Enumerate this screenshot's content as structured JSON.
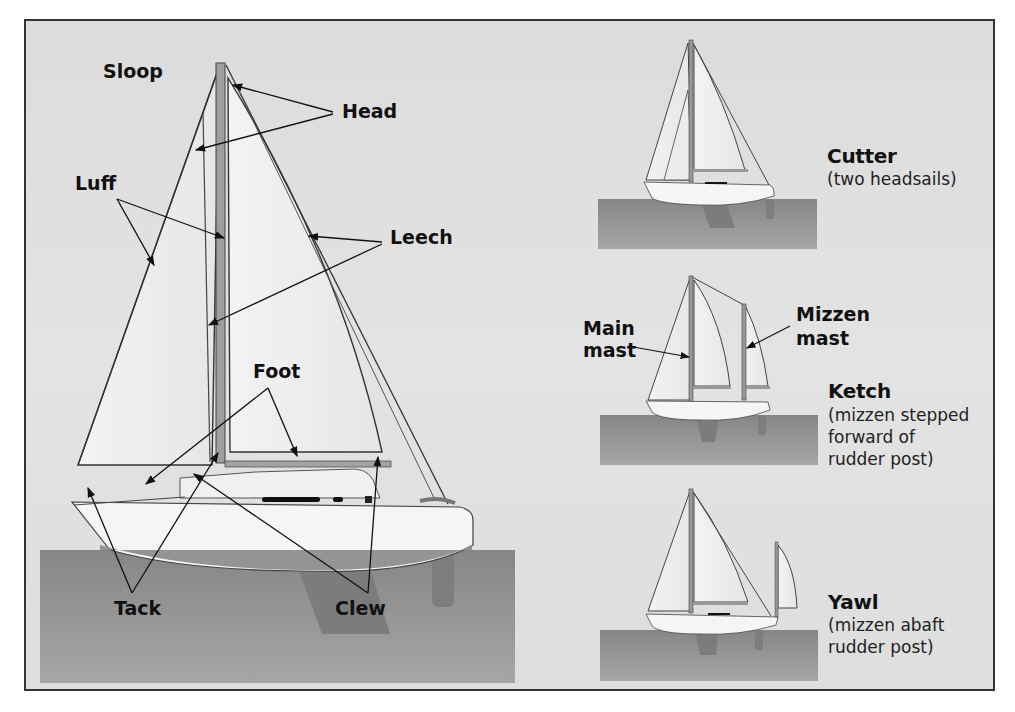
{
  "colors": {
    "background": "#dedede",
    "frame_border": "#333333",
    "water": "#8f8f8f",
    "water_dark": "#7a7a7a",
    "hull": "#f4f4f4",
    "sail": "#efefef",
    "mast": "#9a9a9a",
    "line": "#222222"
  },
  "sloop": {
    "name": "Sloop",
    "parts": {
      "head": "Head",
      "luff": "Luff",
      "leech": "Leech",
      "foot": "Foot",
      "tack": "Tack",
      "clew": "Clew"
    }
  },
  "rigs": [
    {
      "name": "Cutter",
      "description": "(two headsails)"
    },
    {
      "name": "Ketch",
      "description_lines": [
        "(mizzen stepped",
        "forward of",
        "rudder post)"
      ],
      "labels": {
        "main_mast_line1": "Main",
        "main_mast_line2": "mast",
        "mizzen_mast_line1": "Mizzen",
        "mizzen_mast_line2": "mast"
      }
    },
    {
      "name": "Yawl",
      "description_lines": [
        "(mizzen abaft",
        "rudder post)"
      ]
    }
  ]
}
